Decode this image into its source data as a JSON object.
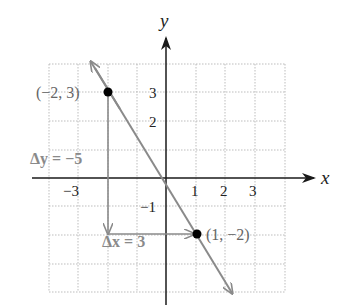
{
  "diagram": {
    "type": "coordinate-plane-slope",
    "axes": {
      "x_label": "x",
      "y_label": "y",
      "x_ticks": [
        {
          "value": -3,
          "label": "−3"
        },
        {
          "value": -1,
          "label": "−1"
        },
        {
          "value": 1,
          "label": "1"
        },
        {
          "value": 2,
          "label": "2"
        },
        {
          "value": 3,
          "label": "3"
        }
      ],
      "y_ticks": [
        {
          "value": 3,
          "label": "3"
        },
        {
          "value": 2,
          "label": "2"
        }
      ],
      "grid_range": {
        "xmin": -4,
        "xmax": 4,
        "ymin": -4,
        "ymax": 4
      }
    },
    "points": [
      {
        "x": -2,
        "y": 3,
        "label": "(−2, 3)"
      },
      {
        "x": 1,
        "y": -2,
        "label": "(1, −2)"
      }
    ],
    "annotations": {
      "delta_y": "Δy = −5",
      "delta_x": "Δx = 3"
    },
    "line": {
      "slope": "-5/3",
      "through": [
        [
          -2,
          3
        ],
        [
          1,
          -2
        ]
      ]
    },
    "colors": {
      "axis": "#1a1a1a",
      "line": "#8a8a8a",
      "grid": "#b0b0b0",
      "point": "#000000",
      "label_gray": "#8a8a8a"
    }
  }
}
